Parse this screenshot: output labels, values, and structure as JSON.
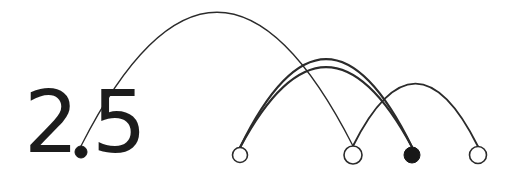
{
  "figure": {
    "title_text": "2.5",
    "title_digit_left": "2",
    "title_digit_right": "5",
    "background_color": "#ffffff",
    "ink_color": "#1c1c1c",
    "stroke_color": "#2b2b2b",
    "node_fill_hollow": "#ffffff",
    "node_fill_solid": "#181818",
    "canvas_width": 513,
    "canvas_height": 176,
    "baseline_y": 155
  },
  "chart_data": {
    "type": "diagram",
    "subtype": "arc-diagram",
    "title": "2.5",
    "xlabel": "",
    "ylabel": "",
    "grid": false,
    "legend": "none",
    "baseline_y": 155,
    "nodes": [
      {
        "id": "n0",
        "label": "",
        "x": 81,
        "y": 152,
        "radius": 6.0,
        "style": "filled",
        "role": "decimal-point"
      },
      {
        "id": "n1",
        "label": "",
        "x": 240,
        "y": 155,
        "radius": 7.5,
        "style": "hollow",
        "role": "endpoint"
      },
      {
        "id": "n2",
        "label": "",
        "x": 353,
        "y": 155,
        "radius": 9.0,
        "style": "hollow",
        "role": "endpoint"
      },
      {
        "id": "n3",
        "label": "",
        "x": 412,
        "y": 155,
        "radius": 8.0,
        "style": "filled",
        "role": "endpoint"
      },
      {
        "id": "n4",
        "label": "",
        "x": 478,
        "y": 155,
        "radius": 8.5,
        "style": "hollow",
        "role": "endpoint"
      }
    ],
    "edges": [
      {
        "id": "e0",
        "source": "n0",
        "target": "n2",
        "peak_y": 16,
        "stroke_width": 1.3,
        "label": ""
      },
      {
        "id": "e1",
        "source": "n1",
        "target": "n3",
        "peak_y": 63,
        "stroke_width": 2.1,
        "label": ""
      },
      {
        "id": "e2",
        "source": "n1",
        "target": "n3",
        "peak_y": 71,
        "stroke_width": 2.1,
        "label": ""
      },
      {
        "id": "e3",
        "source": "n2",
        "target": "n4",
        "peak_y": 88,
        "stroke_width": 1.9,
        "label": ""
      }
    ]
  },
  "numeral": {
    "x": 24,
    "y": 152,
    "font_size": 86
  }
}
